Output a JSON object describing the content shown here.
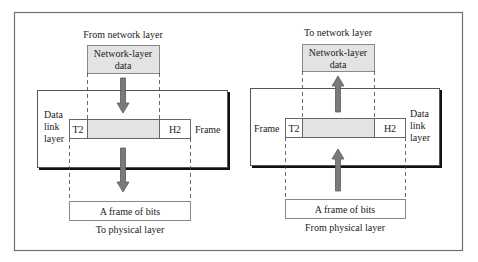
{
  "colors": {
    "outer_border": "#6e6e6e",
    "panel_border": "#555555",
    "panel_shadow": "#111111",
    "box_fill_gray": "#e3e3e3",
    "box_border": "#8a8a8a",
    "arrow_fill": "#7a7a7a",
    "arrow_stroke": "#5a5a5a",
    "text": "#222222"
  },
  "sender": {
    "top_label": "From network layer",
    "payload_box": {
      "line1": "Network-layer",
      "line2": "data"
    },
    "layer_label": {
      "line1": "Data",
      "line2": "link",
      "line3": "layer"
    },
    "frame_label": "Frame",
    "trailer": "T2",
    "header": "H2",
    "bits_box": "A frame of bits",
    "bottom_label": "To physical layer",
    "arrow_direction": "down"
  },
  "receiver": {
    "top_label": "To network layer",
    "payload_box": {
      "line1": "Network-layer",
      "line2": "data"
    },
    "layer_label": {
      "line1": "Data",
      "line2": "link",
      "line3": "layer"
    },
    "frame_label": "Frame",
    "trailer": "T2",
    "header": "H2",
    "bits_box": "A frame of bits",
    "bottom_label": "From physical layer",
    "arrow_direction": "up"
  }
}
